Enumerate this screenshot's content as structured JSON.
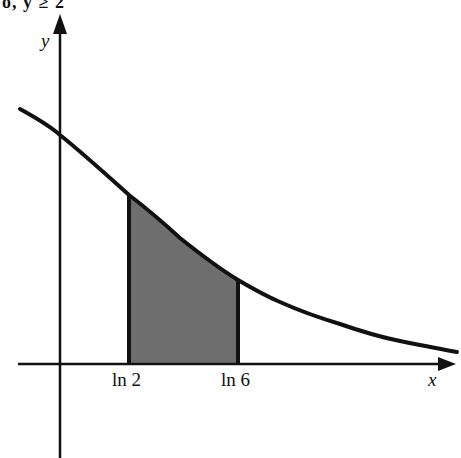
{
  "top_fragment": "o, y ≥ 2",
  "axes": {
    "x_label": "x",
    "y_label": "y"
  },
  "ticks": [
    {
      "label": "ln 2",
      "px": 129
    },
    {
      "label": "ln 6",
      "px": 238
    }
  ],
  "curve": {
    "description": "decreasing curve approaching x-axis",
    "points_px": [
      [
        20,
        109
      ],
      [
        60,
        135
      ],
      [
        129,
        195
      ],
      [
        180,
        240
      ],
      [
        238,
        280
      ],
      [
        280,
        302
      ],
      [
        340,
        324
      ],
      [
        400,
        341
      ],
      [
        457,
        352
      ]
    ]
  },
  "shaded_region": {
    "from": "ln 2",
    "to": "ln 6",
    "fill": "#6e6e6e"
  },
  "colors": {
    "stroke": "#111111",
    "fill": "#6e6e6e",
    "background": "#ffffff"
  }
}
